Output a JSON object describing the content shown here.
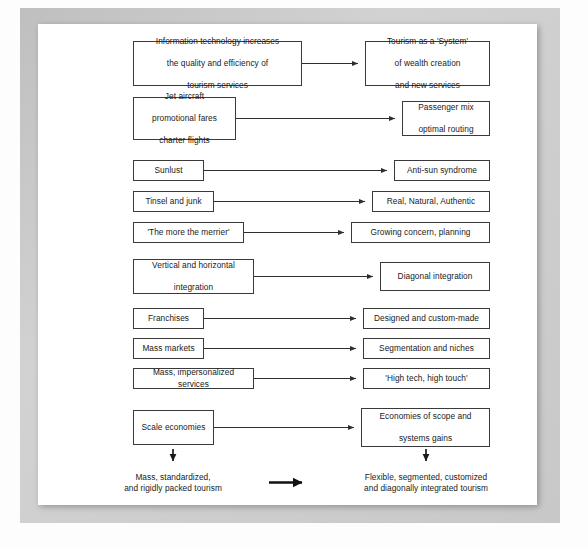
{
  "diagram": {
    "line_color": "#2f2f2f",
    "box_border_color": "#3a3a3a",
    "page_background": "#c8c8c8",
    "sheet_background": "#ffffff",
    "rows": [
      {
        "id": "row-1",
        "left": "Information technology increases\nthe quality and efficiency of\ntourism services",
        "left_lines": [
          "Information technology increases",
          "the quality and efficiency of",
          "tourism services"
        ],
        "right_lines": [
          "Tourism as a 'System'",
          "of wealth creation",
          "and new services"
        ]
      },
      {
        "id": "row-2",
        "left_lines": [
          "Jet aircraft",
          "promotional fares",
          "charter flights"
        ],
        "right_lines": [
          "Passenger mix",
          "optimal routing"
        ]
      },
      {
        "id": "row-3",
        "left_lines": [
          "Sunlust"
        ],
        "right_lines": [
          "Anti-sun syndrome"
        ]
      },
      {
        "id": "row-4",
        "left_lines": [
          "Tinsel and junk"
        ],
        "right_lines": [
          "Real, Natural, Authentic"
        ]
      },
      {
        "id": "row-5",
        "left_lines": [
          "'The more the merrier'"
        ],
        "right_lines": [
          "Growing concern, planning"
        ]
      },
      {
        "id": "row-6",
        "left_lines": [
          "Vertical and horizontal",
          "integration"
        ],
        "right_lines": [
          "Diagonal integration"
        ]
      },
      {
        "id": "row-7",
        "left_lines": [
          "Franchises"
        ],
        "right_lines": [
          "Designed and custom-made"
        ]
      },
      {
        "id": "row-8",
        "left_lines": [
          "Mass markets"
        ],
        "right_lines": [
          "Segmentation and niches"
        ]
      },
      {
        "id": "row-9",
        "left_lines": [
          "Mass, impersonalized services"
        ],
        "right_lines": [
          "'High tech, high touch'"
        ]
      },
      {
        "id": "row-10",
        "left_lines": [
          "Scale economies"
        ],
        "right_lines": [
          "Economies of scope and",
          "systems gains"
        ]
      }
    ],
    "summary": {
      "left_lines": [
        "Mass, standardized,",
        "and rigidly packed tourism"
      ],
      "right_lines": [
        "Flexible, segmented, customized",
        "and diagonally integrated tourism"
      ],
      "center_arrow": "thick-right-arrow"
    },
    "nodes": {
      "n1l_1": "Information technology increases",
      "n1l_2": "the quality and efficiency of",
      "n1l_3": "tourism services",
      "n1r_1": "Tourism as a 'System'",
      "n1r_2": "of wealth creation",
      "n1r_3": "and new services",
      "n2l_1": "Jet aircraft",
      "n2l_2": "promotional fares",
      "n2l_3": "charter flights",
      "n2r_1": "Passenger mix",
      "n2r_2": "optimal routing",
      "n3l": "Sunlust",
      "n3r": "Anti-sun syndrome",
      "n4l": "Tinsel and junk",
      "n4r": "Real, Natural, Authentic",
      "n5l": "'The more the merrier'",
      "n5r": "Growing concern, planning",
      "n6l_1": "Vertical and horizontal",
      "n6l_2": "integration",
      "n6r": "Diagonal integration",
      "n7l": "Franchises",
      "n7r": "Designed and custom-made",
      "n8l": "Mass markets",
      "n8r": "Segmentation and niches",
      "n9l": "Mass, impersonalized services",
      "n9r": "'High tech, high touch'",
      "n10l": "Scale economies",
      "n10r_1": "Economies of scope and",
      "n10r_2": "systems gains",
      "sum_l_1": "Mass, standardized,",
      "sum_l_2": "and rigidly packed tourism",
      "sum_r_1": "Flexible, segmented, customized",
      "sum_r_2": "and diagonally integrated tourism"
    }
  }
}
